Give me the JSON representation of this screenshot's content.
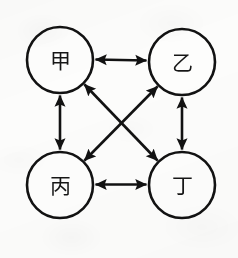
{
  "diagram": {
    "title": "",
    "type": "undirected-graph",
    "canvas": {
      "width": 238,
      "height": 258,
      "background": "#fcfcfb"
    },
    "style": {
      "stroke_color": "#121212",
      "node_fill": "#fdfdfc",
      "label_color": "#161616",
      "stroke_width": 2.6,
      "node_radius": 33
    },
    "nodes": [
      {
        "id": "jia",
        "label": "甲",
        "cx": 60,
        "cy": 60,
        "r": 33
      },
      {
        "id": "yi",
        "label": "乙",
        "cx": 182,
        "cy": 62,
        "r": 33
      },
      {
        "id": "bing",
        "label": "丙",
        "cx": 60,
        "cy": 185,
        "r": 33
      },
      {
        "id": "ding",
        "label": "丁",
        "cx": 182,
        "cy": 185,
        "r": 33
      }
    ],
    "edges": [
      {
        "id": "jia-yi",
        "from": "jia",
        "to": "yi",
        "arrows": "both",
        "orientation": "horizontal-top"
      },
      {
        "id": "bing-ding",
        "from": "bing",
        "to": "ding",
        "arrows": "both",
        "orientation": "horizontal-bottom"
      },
      {
        "id": "jia-bing",
        "from": "jia",
        "to": "bing",
        "arrows": "both",
        "orientation": "vertical-left"
      },
      {
        "id": "yi-ding",
        "from": "yi",
        "to": "ding",
        "arrows": "both",
        "orientation": "vertical-right"
      },
      {
        "id": "jia-ding",
        "from": "jia",
        "to": "ding",
        "arrows": "both",
        "orientation": "diagonal-tlbr"
      },
      {
        "id": "yi-bing",
        "from": "yi",
        "to": "bing",
        "arrows": "both",
        "orientation": "diagonal-trbl"
      }
    ],
    "edge_count": 6,
    "node_count": 4
  }
}
